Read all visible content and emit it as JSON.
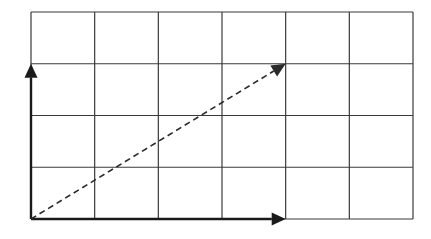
{
  "diagram": {
    "type": "vector-addition-grid",
    "grid": {
      "columns": 6,
      "rows": 4,
      "origin_px": [
        31,
        12
      ],
      "size_px": [
        382,
        207
      ],
      "line_color": "#3a3a3a"
    },
    "vectors": [
      {
        "name": "vertical-vector",
        "from": [
          0,
          0
        ],
        "to": [
          0,
          3
        ],
        "style": "solid",
        "color": "#1a1a1a"
      },
      {
        "name": "horizontal-vector",
        "from": [
          0,
          0
        ],
        "to": [
          4,
          0
        ],
        "style": "solid",
        "color": "#1a1a1a"
      },
      {
        "name": "resultant-vector",
        "from": [
          0,
          0
        ],
        "to": [
          4,
          3
        ],
        "style": "dashed",
        "color": "#2a2a2a"
      }
    ]
  }
}
